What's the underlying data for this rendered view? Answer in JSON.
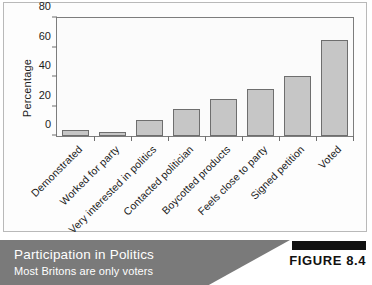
{
  "chart_data": {
    "type": "bar",
    "title": "",
    "xlabel": "",
    "ylabel": "Percentage",
    "ylim": [
      0,
      80
    ],
    "yticks": [
      0,
      20,
      40,
      60,
      80
    ],
    "grid": false,
    "legend": false,
    "orientation": "vertical",
    "bar_fill_color": "#c6c6c6",
    "bar_border_color": "#6e6e6e",
    "categories": [
      "Demonstrated",
      "Worked for party",
      "Very interested in politics",
      "Contacted politician",
      "Boycotted products",
      "Feels close to party",
      "Signed petition",
      "Voted"
    ],
    "values": [
      4,
      3,
      11,
      18,
      25,
      32,
      41,
      65
    ]
  },
  "caption": {
    "title": "Participation in Politics",
    "subtitle": "Most Britons are only voters",
    "figure_label": "FIGURE 8.4"
  }
}
